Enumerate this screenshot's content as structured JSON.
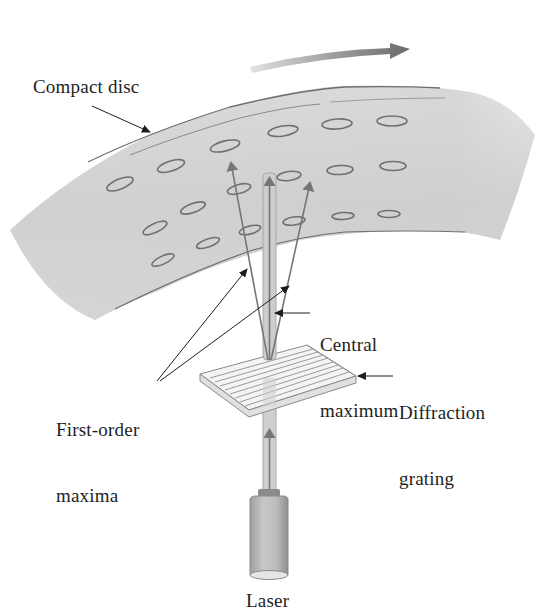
{
  "figure": {
    "type": "diagram"
  },
  "labels": {
    "compact_disc": "Compact disc",
    "central_maximum_line1": "Central",
    "central_maximum_line2": "maximum",
    "first_order_line1": "First-order",
    "first_order_line2": "maxima",
    "diffraction_line1": "Diffraction",
    "diffraction_line2": "grating",
    "laser": "Laser"
  },
  "components": {
    "rotation_arrow": {
      "direction": "right",
      "meaning": "disc rotation"
    },
    "disc_pits": {
      "rows": 3,
      "per_row": 6
    },
    "beams": [
      "central maximum",
      "first-order maximum (left)",
      "first-order maximum (right)"
    ]
  },
  "colors": {
    "disc_fill": "#d2d2d2",
    "disc_edge": "#6e6e6e",
    "pit_stroke": "#707070",
    "ray": "#767676",
    "beam": "#c4c4c4",
    "pointer": "#1e1e1e",
    "arrow_dark": "#6a6a6a",
    "arrow_light": "#dcdcdc",
    "laser_body": "#bdbdbd",
    "text": "#1e1e1e"
  }
}
